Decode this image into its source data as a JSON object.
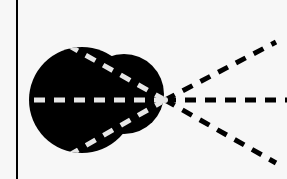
{
  "diagram": {
    "colors": {
      "background": "#f7f7f7",
      "ink": "#000000",
      "dash_on_blob": "#e6e6e6"
    },
    "vertical_line": {
      "x": 17,
      "y1": 0,
      "y2": 179
    },
    "blob": {
      "main_circle": {
        "cx": 82,
        "cy": 100,
        "r": 53
      },
      "lobe_circle": {
        "cx": 124,
        "cy": 94,
        "r": 40
      }
    },
    "apex": {
      "x": 165,
      "y": 100
    },
    "rays": [
      {
        "name": "upper",
        "from": [
          64,
          43
        ],
        "to": [
          276,
          42
        ]
      },
      {
        "name": "middle",
        "from": [
          30,
          100
        ],
        "to": [
          287,
          100
        ]
      },
      {
        "name": "lower",
        "from": [
          64,
          158
        ],
        "to": [
          276,
          163
        ]
      }
    ]
  }
}
